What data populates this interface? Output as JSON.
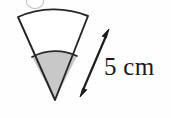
{
  "figure": {
    "kind": "geometry-diagram",
    "background_color": "#fefefe",
    "outline_color": "#262626",
    "shaded_fill_color": "#c8c8c8",
    "unshaded_fill_color": "#ffffff",
    "sector": {
      "apex": {
        "x": 55,
        "y": 100
      },
      "outer_radius_px": 90,
      "inner_radius_px": 50,
      "outer_arc_left": {
        "x": 18,
        "y": 17
      },
      "outer_arc_right": {
        "x": 88,
        "y": 16
      },
      "inner_arc_left": {
        "x": 32,
        "y": 57
      },
      "inner_arc_right": {
        "x": 77,
        "y": 56
      }
    },
    "dimension": {
      "label": "5 cm",
      "value": 5,
      "unit": "cm",
      "arrow_style": "double-headed",
      "arrow_tail": {
        "x": 80,
        "y": 97
      },
      "arrow_tip": {
        "x": 109,
        "y": 29
      },
      "measures": "slant radius of the sector"
    },
    "artifact": {
      "name": "cut-off-glyph",
      "note": "faint partial character clipped at the top edge of the scan"
    }
  }
}
